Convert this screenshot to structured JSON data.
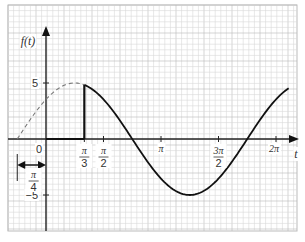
{
  "chart_data": {
    "type": "line",
    "title": "",
    "xlabel": "t",
    "ylabel": "f(t)",
    "function": "f(t) = 5 sin(t + π/4)",
    "amplitude": 5,
    "phase_shift": "π/4",
    "phase_shift_label": {
      "num": "π",
      "den": "4"
    },
    "xlim_rad": [
      -0.85,
      2.12
    ],
    "ylim": [
      -6.5,
      11.5
    ],
    "grid": true,
    "origin_label": "0",
    "y_ticks": [
      {
        "value": 5,
        "label": "5"
      },
      {
        "value": -5,
        "label": "−5"
      }
    ],
    "x_ticks": [
      {
        "value_pi": 0.3333,
        "num": "π",
        "den": "3"
      },
      {
        "value_pi": 0.5,
        "num": "π",
        "den": "2"
      },
      {
        "value_pi": 1.0,
        "label": "π"
      },
      {
        "value_pi": 1.5,
        "num": "3π",
        "den": "2"
      },
      {
        "value_pi": 2.0,
        "label": "2π"
      }
    ],
    "series": [
      {
        "name": "dashed-extension",
        "style": "dashed",
        "t_range_pi": [
          -0.25,
          0.3333
        ]
      },
      {
        "name": "solid-curve",
        "style": "solid",
        "t_range_pi": [
          0.3333,
          2.11
        ]
      }
    ],
    "step_segment": {
      "t_pi": 0.3333,
      "from_y": 0,
      "to_y": 5
    }
  }
}
